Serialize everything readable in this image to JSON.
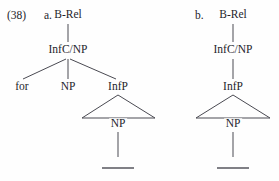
{
  "example": {
    "number_label": "(38)"
  },
  "trees": [
    {
      "id": "tree-a",
      "letter_label": "a.",
      "root": "B-Rel",
      "nodes": [
        {
          "name": "root-node-a",
          "text": "B-Rel",
          "x": 68,
          "y": 15
        },
        {
          "name": "infc-np-node-a",
          "text": "InfC/NP",
          "x": 68,
          "y": 50
        },
        {
          "name": "for-node-a",
          "text": "for",
          "x": 22,
          "y": 87
        },
        {
          "name": "np-subject-node-a",
          "text": "NP",
          "x": 68,
          "y": 87
        },
        {
          "name": "infp-node-a",
          "text": "InfP",
          "x": 118,
          "y": 87
        },
        {
          "name": "np-trace-node-a",
          "text": "NP",
          "x": 118,
          "y": 124
        }
      ],
      "triangle": {
        "apex_x": 118,
        "apex_y": 95,
        "left_x": 82,
        "right_x": 155,
        "base_y": 118
      },
      "trace": {
        "x1": 102,
        "x2": 134,
        "y": 168
      }
    },
    {
      "id": "tree-b",
      "letter_label": "b.",
      "root": "B-Rel",
      "nodes": [
        {
          "name": "root-node-b",
          "text": "B-Rel",
          "x": 233,
          "y": 15
        },
        {
          "name": "infc-np-node-b",
          "text": "InfC/NP",
          "x": 233,
          "y": 50
        },
        {
          "name": "infp-node-b",
          "text": "InfP",
          "x": 233,
          "y": 87
        },
        {
          "name": "np-trace-node-b",
          "text": "NP",
          "x": 233,
          "y": 124
        }
      ],
      "triangle": {
        "apex_x": 233,
        "apex_y": 95,
        "left_x": 196,
        "right_x": 270,
        "base_y": 118
      },
      "trace": {
        "x1": 217,
        "x2": 249,
        "y": 168
      }
    }
  ],
  "labels": {
    "example_number_pos": {
      "x": 7,
      "y": 10
    },
    "letter_a_pos": {
      "x": 44,
      "y": 10
    },
    "letter_b_pos": {
      "x": 195,
      "y": 10
    }
  },
  "colors": {
    "ink": "#25252b",
    "line": "#4a4a52",
    "background": "#fefefe"
  }
}
